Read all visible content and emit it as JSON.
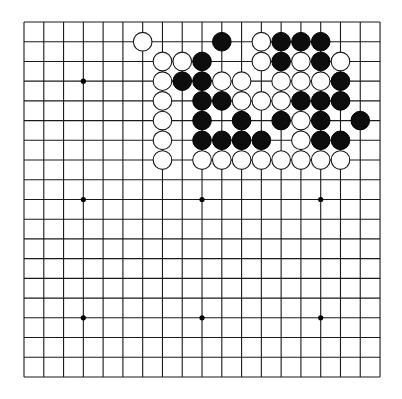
{
  "board": {
    "size": 19,
    "origin": {
      "x": 24,
      "y": 22
    },
    "spacing": {
      "x": 19.78,
      "y": 19.72
    },
    "colors": {
      "background": "#ffffff",
      "line": "#1a1a1a",
      "black_stone": "#0d0d0d",
      "white_stone": "#ffffff"
    },
    "star_points": [
      [
        3,
        3
      ],
      [
        9,
        3
      ],
      [
        15,
        3
      ],
      [
        3,
        9
      ],
      [
        9,
        9
      ],
      [
        15,
        9
      ],
      [
        3,
        15
      ],
      [
        9,
        15
      ],
      [
        15,
        15
      ]
    ],
    "stones": [
      {
        "color": "white",
        "col": 6,
        "row": 1
      },
      {
        "color": "black",
        "col": 10,
        "row": 1
      },
      {
        "color": "white",
        "col": 12,
        "row": 1
      },
      {
        "color": "black",
        "col": 13,
        "row": 1
      },
      {
        "color": "black",
        "col": 14,
        "row": 1
      },
      {
        "color": "black",
        "col": 15,
        "row": 1
      },
      {
        "color": "white",
        "col": 7,
        "row": 2
      },
      {
        "color": "white",
        "col": 8,
        "row": 2
      },
      {
        "color": "black",
        "col": 9,
        "row": 2
      },
      {
        "color": "white",
        "col": 12,
        "row": 2
      },
      {
        "color": "black",
        "col": 13,
        "row": 2
      },
      {
        "color": "white",
        "col": 14,
        "row": 2
      },
      {
        "color": "black",
        "col": 15,
        "row": 2
      },
      {
        "color": "white",
        "col": 16,
        "row": 2
      },
      {
        "color": "white",
        "col": 7,
        "row": 3
      },
      {
        "color": "black",
        "col": 8,
        "row": 3
      },
      {
        "color": "black",
        "col": 9,
        "row": 3
      },
      {
        "color": "white",
        "col": 10,
        "row": 3
      },
      {
        "color": "white",
        "col": 11,
        "row": 3
      },
      {
        "color": "white",
        "col": 13,
        "row": 3
      },
      {
        "color": "white",
        "col": 14,
        "row": 3
      },
      {
        "color": "white",
        "col": 15,
        "row": 3
      },
      {
        "color": "black",
        "col": 16,
        "row": 3
      },
      {
        "color": "white",
        "col": 7,
        "row": 4
      },
      {
        "color": "black",
        "col": 9,
        "row": 4
      },
      {
        "color": "black",
        "col": 10,
        "row": 4
      },
      {
        "color": "white",
        "col": 11,
        "row": 4
      },
      {
        "color": "white",
        "col": 12,
        "row": 4
      },
      {
        "color": "white",
        "col": 13,
        "row": 4
      },
      {
        "color": "black",
        "col": 14,
        "row": 4
      },
      {
        "color": "black",
        "col": 15,
        "row": 4
      },
      {
        "color": "black",
        "col": 16,
        "row": 4
      },
      {
        "color": "white",
        "col": 7,
        "row": 5
      },
      {
        "color": "black",
        "col": 9,
        "row": 5
      },
      {
        "color": "black",
        "col": 11,
        "row": 5
      },
      {
        "color": "black",
        "col": 13,
        "row": 5
      },
      {
        "color": "white",
        "col": 14,
        "row": 5
      },
      {
        "color": "black",
        "col": 15,
        "row": 5
      },
      {
        "color": "black",
        "col": 17,
        "row": 5
      },
      {
        "color": "white",
        "col": 7,
        "row": 6
      },
      {
        "color": "black",
        "col": 9,
        "row": 6
      },
      {
        "color": "black",
        "col": 10,
        "row": 6
      },
      {
        "color": "black",
        "col": 11,
        "row": 6
      },
      {
        "color": "black",
        "col": 12,
        "row": 6
      },
      {
        "color": "white",
        "col": 14,
        "row": 6
      },
      {
        "color": "black",
        "col": 15,
        "row": 6
      },
      {
        "color": "black",
        "col": 16,
        "row": 6
      },
      {
        "color": "white",
        "col": 7,
        "row": 7
      },
      {
        "color": "white",
        "col": 9,
        "row": 7
      },
      {
        "color": "white",
        "col": 10,
        "row": 7
      },
      {
        "color": "white",
        "col": 11,
        "row": 7
      },
      {
        "color": "white",
        "col": 12,
        "row": 7
      },
      {
        "color": "white",
        "col": 13,
        "row": 7
      },
      {
        "color": "white",
        "col": 14,
        "row": 7
      },
      {
        "color": "white",
        "col": 15,
        "row": 7
      },
      {
        "color": "white",
        "col": 16,
        "row": 7
      }
    ],
    "stone_counts": {
      "black": 27,
      "white": 30
    }
  }
}
